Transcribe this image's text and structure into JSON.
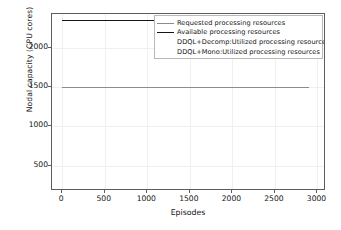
{
  "chart_data": {
    "type": "line",
    "title": "",
    "xlabel": "Episodes",
    "ylabel": "Nodal capacity (CPU cores)",
    "xlim": [
      -120,
      3100
    ],
    "ylim": [
      180,
      2430
    ],
    "xticks": [
      0,
      500,
      1000,
      1500,
      2000,
      2500,
      3000
    ],
    "xtick_labels": [
      "0",
      "500",
      "1000",
      "1500",
      "2000",
      "2500",
      "3000"
    ],
    "yticks": [
      500,
      1000,
      1500,
      2000
    ],
    "ytick_labels": [
      "500",
      "1000",
      "1500",
      "2000"
    ],
    "grid": true,
    "legend_position": "upper right",
    "series": [
      {
        "name": "Requested processing  resources",
        "color": "#8c8c8c",
        "linewidth": 1.0,
        "visible_in_plot": false,
        "x": [
          0,
          2900
        ],
        "values": [
          1500,
          1500
        ]
      },
      {
        "name": "Available processing  resources",
        "color": "#141414",
        "linewidth": 1.9,
        "visible_in_plot": true,
        "x": [
          0,
          2900
        ],
        "values": [
          2350,
          2350
        ]
      },
      {
        "name": "DDQL+Decomp:Utilized processing  resources",
        "color": "#ffffff",
        "linewidth": 1.0,
        "visible_in_plot": false,
        "x": [
          0,
          2900
        ],
        "values": [
          null,
          null
        ]
      },
      {
        "name": "DDQL+Mono:Utilized processing  resources",
        "color": "#ffffff",
        "linewidth": 1.0,
        "visible_in_plot": false,
        "x": [
          0,
          2900
        ],
        "values": [
          null,
          null
        ]
      }
    ],
    "plotted_lines": [
      {
        "label": "Available processing  resources",
        "y": 2350,
        "x_start": 0,
        "x_end": 1080,
        "color": "#141414",
        "width": 1.9
      },
      {
        "label": "Requested processing  resources",
        "y": 1500,
        "x_start": 0,
        "x_end": 2900,
        "color": "#8c8c8c",
        "width": 1.0
      }
    ]
  }
}
